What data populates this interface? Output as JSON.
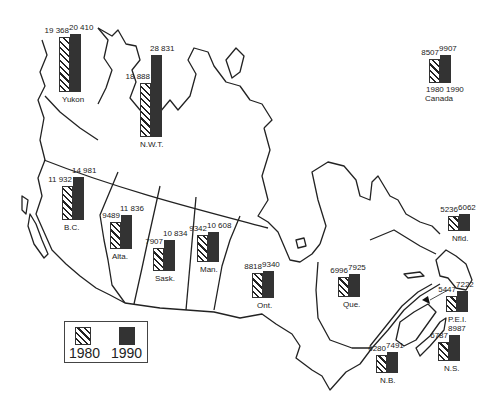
{
  "chart_data": {
    "type": "bar",
    "title": "",
    "xlabel": "",
    "ylabel": "",
    "legend": {
      "position": "bottom-left",
      "entries": [
        {
          "label": "1980",
          "style": "hatched"
        },
        {
          "label": "1990",
          "style": "solid-dark"
        }
      ]
    },
    "categories": [
      "Yukon",
      "N.W.T.",
      "B.C.",
      "Alta.",
      "Sask.",
      "Man.",
      "Ont.",
      "Que.",
      "Nfld.",
      "P.E.I.",
      "N.B.",
      "N.S.",
      "Canada"
    ],
    "series": [
      {
        "name": "1980",
        "values": [
          19368,
          18888,
          11932,
          9489,
          7907,
          9342,
          8818,
          6996,
          5236,
          5447,
          6280,
          6787,
          8507
        ]
      },
      {
        "name": "1990",
        "values": [
          20410,
          28831,
          14981,
          11836,
          10834,
          10608,
          9340,
          7925,
          6062,
          7222,
          7491,
          8987,
          9907
        ]
      }
    ],
    "value_labels": {
      "Yukon": [
        "19 368",
        "20 410"
      ],
      "N.W.T.": [
        "18 888",
        "28 831"
      ],
      "B.C.": [
        "11 932",
        "14 981"
      ],
      "Alta.": [
        "9489",
        "11 836"
      ],
      "Sask.": [
        "7907",
        "10 834"
      ],
      "Man.": [
        "9342",
        "10 608"
      ],
      "Ont.": [
        "8818",
        "9340"
      ],
      "Que.": [
        "6996",
        "7925"
      ],
      "Nfld.": [
        "5236",
        "6062"
      ],
      "P.E.I.": [
        "5447",
        "7222"
      ],
      "N.B.": [
        "6280",
        "7491"
      ],
      "N.S.": [
        "6787",
        "8987"
      ],
      "Canada": [
        "8507",
        "9907"
      ]
    },
    "canada_axis_labels": [
      "1980",
      "1990"
    ],
    "background": "outline map of Canada with provincial boundaries"
  },
  "groups": [
    {
      "id": "yukon",
      "name": "Yukon",
      "v1": "19 368",
      "v2": "20 410",
      "n1": 19368,
      "n2": 20410,
      "x": 59,
      "base": 92,
      "lx": 62
    },
    {
      "id": "nwt",
      "name": "N.W.T.",
      "v1": "18 888",
      "v2": "28 831",
      "n1": 18888,
      "n2": 28831,
      "x": 140,
      "base": 137,
      "lx": 140
    },
    {
      "id": "bc",
      "name": "B.C.",
      "v1": "11 932",
      "v2": "14 981",
      "n1": 11932,
      "n2": 14981,
      "x": 62,
      "base": 220,
      "lx": 64
    },
    {
      "id": "alta",
      "name": "Alta.",
      "v1": "9489",
      "v2": "11 836",
      "n1": 9489,
      "n2": 11836,
      "x": 110,
      "base": 249,
      "lx": 112
    },
    {
      "id": "sask",
      "name": "Sask.",
      "v1": "7907",
      "v2": "10 834",
      "n1": 7907,
      "n2": 10834,
      "x": 153,
      "base": 271,
      "lx": 155
    },
    {
      "id": "man",
      "name": "Man.",
      "v1": "9342",
      "v2": "10 608",
      "n1": 9342,
      "n2": 10608,
      "x": 197,
      "base": 262,
      "lx": 200
    },
    {
      "id": "ont",
      "name": "Ont.",
      "v1": "8818",
      "v2": "9340",
      "n1": 8818,
      "n2": 9340,
      "x": 252,
      "base": 298,
      "lx": 257
    },
    {
      "id": "que",
      "name": "Que.",
      "v1": "6996",
      "v2": "7925",
      "n1": 6996,
      "n2": 7925,
      "x": 338,
      "base": 297,
      "lx": 343
    },
    {
      "id": "nfld",
      "name": "Nfld.",
      "v1": "5236",
      "v2": "6062",
      "n1": 5236,
      "n2": 6062,
      "x": 448,
      "base": 231,
      "lx": 452
    },
    {
      "id": "pei",
      "name": "P.E.I.",
      "v1": "5447",
      "v2": "7222",
      "n1": 5447,
      "n2": 7222,
      "x": 446,
      "base": 312,
      "lx": 448
    },
    {
      "id": "nb",
      "name": "N.B.",
      "v1": "6280",
      "v2": "7491",
      "n1": 6280,
      "n2": 7491,
      "x": 376,
      "base": 373,
      "lx": 380
    },
    {
      "id": "ns",
      "name": "N.S.",
      "v1": "6787",
      "v2": "8987",
      "n1": 6787,
      "n2": 8987,
      "x": 438,
      "base": 361,
      "lx": 444
    },
    {
      "id": "canada",
      "name": "Canada",
      "v1": "8507",
      "v2": "9907",
      "n1": 8507,
      "n2": 9907,
      "x": 429,
      "base": 83,
      "lx": 425
    }
  ],
  "canada_years": [
    "1980",
    "1990"
  ],
  "legend": {
    "label_1980": "1980",
    "label_1990": "1990"
  },
  "colors": {
    "hatch": "#222222",
    "solid": "#333333",
    "outline": "#222222",
    "background": "#ffffff"
  },
  "scale_px_per_unit": 0.00285
}
